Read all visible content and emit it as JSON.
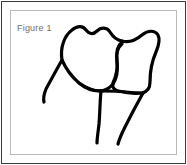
{
  "figure": {
    "caption": "Figure 1",
    "caption_color": "#6e6e6e",
    "background_color": "#ffffff",
    "outer_border_color": "#3a3a3a",
    "inner_border_color": "#b9b9b9",
    "width": 187,
    "height": 165
  },
  "illustration": {
    "name": "tooth-line-drawing",
    "description": "Black line drawing of two adjacent teeth with crowns and roots",
    "stroke_color": "#000000",
    "stroke_width": 3.2,
    "parts": [
      {
        "name": "left-crown-outline",
        "label": "Left tooth crown",
        "path": "M 62 60 C 60 48 64 36 72 30 C 78 25 83 26 86 30 C 89 34 93 35 97 31 C 101 27 107 27 110 32 C 113 37 116 40 122 41 L 122 44 C 118 47 116 54 117 62 C 118 70 117 78 113 84 C 109 89 104 91 99 91 C 92 91 85 88 79 83 C 72 77 66 69 62 60 Z"
      },
      {
        "name": "right-crown-outline",
        "label": "Right tooth crown",
        "path": "M 122 41 C 129 43 136 40 142 35 C 148 30 155 30 158 35 C 160 39 159 45 156 52 C 152 61 150 72 150 82 C 150 88 147 92 142 93 C 135 94 126 93 118 91 C 114 90 112 87 113 83 C 116 76 118 68 117 61 C 116 52 118 45 122 42 Z"
      },
      {
        "name": "left-root",
        "label": "Left tooth root",
        "path": "M 62 60 C 58 67 52 78 46 89 C 44 94 43 98 44 102"
      },
      {
        "name": "center-root",
        "label": "Central root of left tooth",
        "path": "M 101 91 C 100 100 100 112 99 124 C 98 133 97 139 97 143"
      },
      {
        "name": "right-root",
        "label": "Root of right tooth",
        "path": "M 143 93 C 138 102 131 115 125 127 C 121 135 119 140 118 144"
      },
      {
        "name": "crown-root-junction",
        "label": "Junction between crowns and roots",
        "path": "M 79 83 C 86 88 93 91 101 91 C 110 91 118 91 126 92 C 133 93 139 93 143 93"
      }
    ]
  }
}
